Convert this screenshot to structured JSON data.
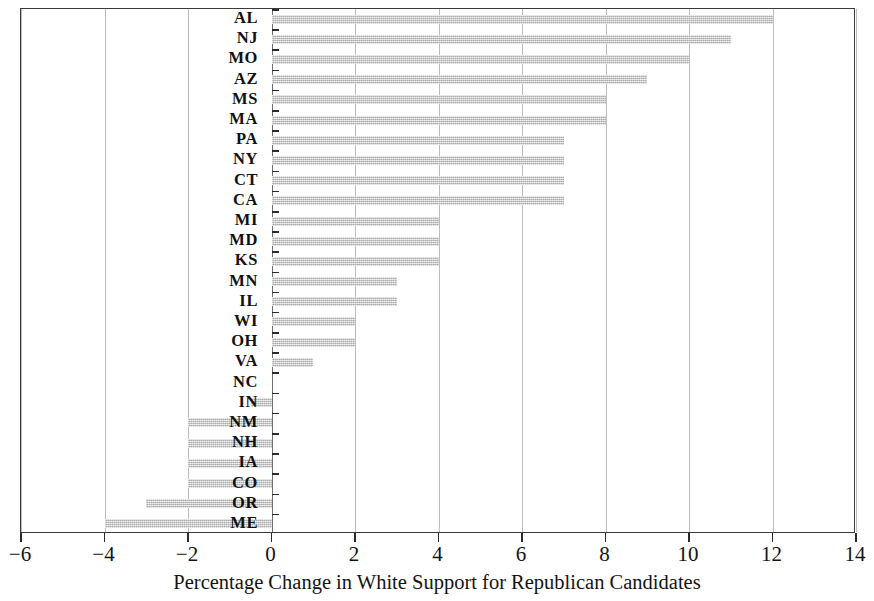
{
  "chart_data": {
    "type": "bar",
    "orientation": "horizontal",
    "title": "",
    "subtitle": "",
    "xlabel": "Percentage Change in White Support for Republican Candidates",
    "ylabel": "",
    "xlim": [
      -6,
      14
    ],
    "ylim": null,
    "xticks": [
      -6,
      -4,
      -2,
      0,
      2,
      4,
      6,
      8,
      10,
      12,
      14
    ],
    "xtick_labels": [
      "−6",
      "−4",
      "−2",
      "0",
      "2",
      "4",
      "6",
      "8",
      "10",
      "12",
      "14"
    ],
    "grid": "vertical",
    "legend": null,
    "bar_color": "#c2c2c2",
    "categories": [
      "AL",
      "NJ",
      "MO",
      "AZ",
      "MS",
      "MA",
      "PA",
      "NY",
      "CT",
      "CA",
      "MI",
      "MD",
      "KS",
      "MN",
      "IL",
      "WI",
      "OH",
      "VA",
      "NC",
      "IN",
      "NM",
      "NH",
      "IA",
      "CO",
      "OR",
      "ME"
    ],
    "values": [
      12,
      11,
      10,
      9,
      8,
      8,
      7,
      7,
      7,
      7,
      4,
      4,
      4,
      3,
      3,
      2,
      2,
      1,
      0,
      -0.5,
      -2,
      -2,
      -2,
      -2,
      -3,
      -4
    ]
  }
}
